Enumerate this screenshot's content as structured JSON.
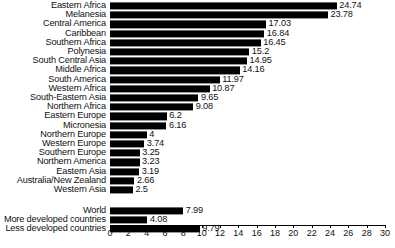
{
  "chart_data": {
    "type": "bar",
    "orientation": "horizontal",
    "title": "",
    "subtitle": "",
    "xlabel": "",
    "ylabel": "",
    "xlim": [
      0,
      30
    ],
    "xticks": [
      0,
      2,
      4,
      6,
      8,
      10,
      12,
      14,
      16,
      18,
      20,
      22,
      24,
      26,
      28,
      30
    ],
    "grid": false,
    "legend": false,
    "bar_color": "#000000",
    "categories": [
      "Eastern Africa",
      "Melanesia",
      "Central America",
      "Caribbean",
      "Southern Africa",
      "Polynesia",
      "South Central Asia",
      "Middle Africa",
      "South America",
      "Western Africa",
      "South-Eastern Asia",
      "Northern Africa",
      "Eastern Europe",
      "Micronesia",
      "Northern Europe",
      "Western Europe",
      "Southern Europe",
      "Northern America",
      "Eastern Asia",
      "Australia/New Zealand",
      "Western Asia",
      "World",
      "More developed countries",
      "Less developed countries"
    ],
    "values": [
      24.74,
      23.78,
      17.03,
      16.84,
      16.45,
      15.2,
      14.95,
      14.16,
      11.97,
      10.87,
      9.65,
      9.08,
      6.2,
      6.16,
      4,
      3.74,
      3.25,
      3.23,
      3.19,
      2.66,
      2.5,
      7.99,
      4.08,
      9.79
    ],
    "value_labels": [
      "24.74",
      "23.78",
      "17.03",
      "16.84",
      "16.45",
      "15.2",
      "14.95",
      "14.16",
      "11.97",
      "10.87",
      "9.65",
      "9.08",
      "6.2",
      "6.16",
      "4",
      "3.74",
      "3.25",
      "3.23",
      "3.19",
      "2.66",
      "2.5",
      "7.99",
      "4.08",
      "9.79"
    ],
    "groups": [
      {
        "name": "regions",
        "start": 0,
        "count": 21
      },
      {
        "name": "aggregates",
        "start": 21,
        "count": 3
      }
    ]
  }
}
